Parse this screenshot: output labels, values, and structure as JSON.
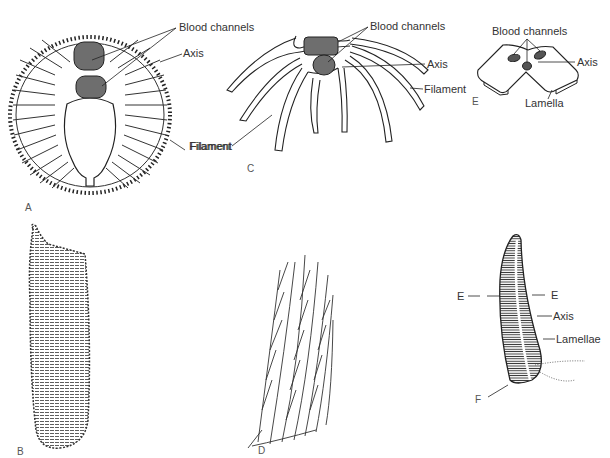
{
  "figure": {
    "panels": {
      "A": {
        "letter": "A",
        "labels": {
          "blood_channels": "Blood channels",
          "axis": "Axis",
          "filament": "Filament"
        }
      },
      "B": {
        "letter": "B"
      },
      "C": {
        "letter": "C",
        "labels": {
          "blood_channels": "Blood channels",
          "axis": "Axis",
          "filament_right": "Filament",
          "filament_left": "Filament"
        }
      },
      "D": {
        "letter": "D"
      },
      "E": {
        "letter": "E",
        "labels": {
          "blood_channels": "Blood channels",
          "axis": "Axis",
          "lamella": "Lamella"
        }
      },
      "F": {
        "letter": "F",
        "labels": {
          "section_left": "E",
          "section_right": "E",
          "axis": "Axis",
          "lamellae": "Lamellae"
        }
      }
    },
    "colors": {
      "ink": "#2a2a2a",
      "channel_fill": "#6e6e6e",
      "background": "#ffffff"
    }
  }
}
